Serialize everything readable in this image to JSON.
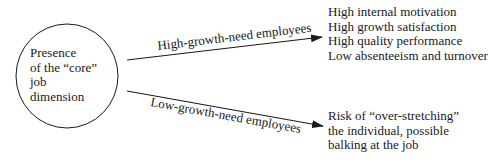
{
  "diagram": {
    "center_node": {
      "lines": [
        "Presence",
        "of the “core”",
        "job",
        "dimension"
      ]
    },
    "arrows": [
      {
        "label": "High-growth-need employees",
        "outcomes": [
          "High internal motivation",
          "High growth satisfaction",
          "High quality performance",
          "Low absenteeism and turnover"
        ]
      },
      {
        "label": "Low-growth-need employees",
        "outcomes": [
          "Risk of “over-stretching”",
          "the individual, possible",
          "balking at the job"
        ]
      }
    ],
    "colors": {
      "stroke": "#1a1a1a",
      "background": "#ffffff"
    }
  }
}
